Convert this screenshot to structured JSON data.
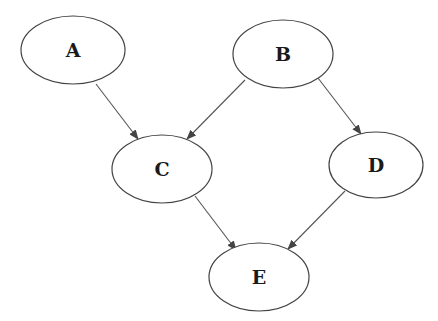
{
  "diagram": {
    "type": "directed-acyclic-graph",
    "colors": {
      "node_stroke": "#444444",
      "edge": "#555555",
      "label": "#1a1a1a",
      "background": "#ffffff"
    },
    "nodes": [
      {
        "id": "A",
        "label": "A",
        "cx": 73,
        "cy": 50,
        "rx": 52,
        "ry": 34
      },
      {
        "id": "B",
        "label": "B",
        "cx": 283,
        "cy": 54,
        "rx": 50,
        "ry": 34
      },
      {
        "id": "C",
        "label": "C",
        "cx": 162,
        "cy": 169,
        "rx": 50,
        "ry": 34
      },
      {
        "id": "D",
        "label": "D",
        "cx": 376,
        "cy": 165,
        "rx": 47,
        "ry": 33
      },
      {
        "id": "E",
        "label": "E",
        "cx": 259,
        "cy": 277,
        "rx": 50,
        "ry": 34
      }
    ],
    "edges": [
      {
        "from": "A",
        "to": "C",
        "x1": 96,
        "y1": 84,
        "x2": 138,
        "y2": 139
      },
      {
        "from": "B",
        "to": "C",
        "x1": 245,
        "y1": 80,
        "x2": 187,
        "y2": 139
      },
      {
        "from": "B",
        "to": "D",
        "x1": 318,
        "y1": 78,
        "x2": 361,
        "y2": 134
      },
      {
        "from": "C",
        "to": "E",
        "x1": 195,
        "y1": 196,
        "x2": 236,
        "y2": 250
      },
      {
        "from": "D",
        "to": "E",
        "x1": 345,
        "y1": 191,
        "x2": 288,
        "y2": 249
      }
    ]
  }
}
